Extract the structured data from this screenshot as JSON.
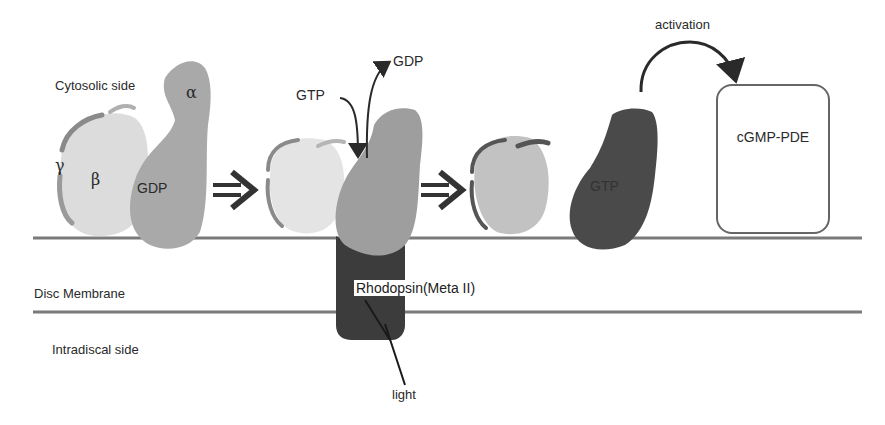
{
  "regions": {
    "cytosolic": "Cytosolic side",
    "membrane": "Disc Membrane",
    "intradiscal": "Intradiscal side"
  },
  "subunits": {
    "alpha": "α",
    "beta": "β",
    "gamma": "γ"
  },
  "nucleotides": {
    "gdp_bound": "GDP",
    "gtp_in": "GTP",
    "gdp_out": "GDP",
    "gtp_bound": "GTP"
  },
  "receptor": {
    "label": "Rhodopsin(Meta II)",
    "stimulus": "light"
  },
  "effector": {
    "label": "cGMP-PDE",
    "arrow_label": "activation"
  },
  "colors": {
    "membrane_line": "#7a7a7a",
    "beta_gamma_light": "#dcdcdc",
    "beta_gamma_mid": "#c2c2c2",
    "alpha_inactive": "#a9a9a9",
    "alpha_active": "#4a4a4a",
    "rhodopsin": "#3c3c3c",
    "gamma_stripe": "#8a8a8a"
  }
}
